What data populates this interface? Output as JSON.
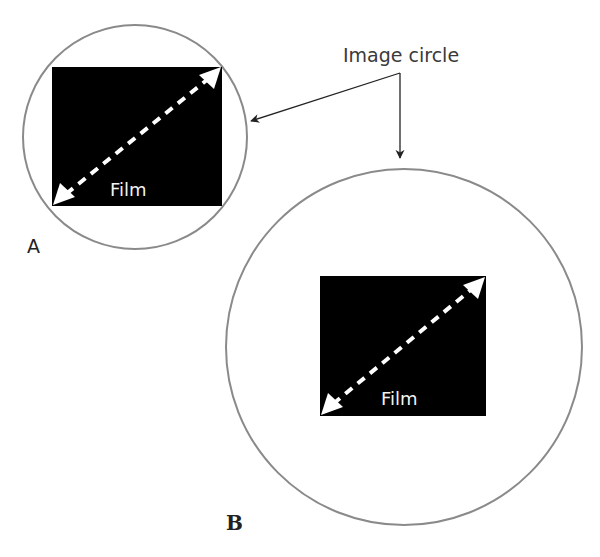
{
  "diagram": {
    "callout": {
      "text": "Image circle"
    },
    "panels": [
      {
        "id": "A",
        "label": "A",
        "film_label": "Film"
      },
      {
        "id": "B",
        "label": "B",
        "film_label": "Film"
      }
    ],
    "colors": {
      "circle_stroke": "#8a8a8a",
      "film_fill": "#000000",
      "diagonal": "#ffffff",
      "arrow": "#222222"
    }
  }
}
